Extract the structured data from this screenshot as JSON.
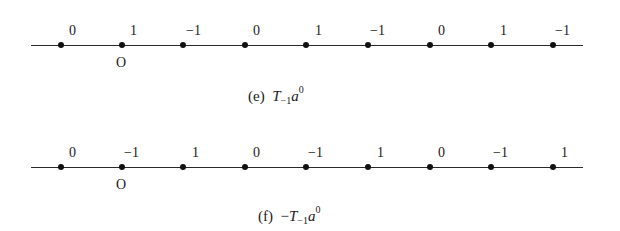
{
  "figures": [
    {
      "id": "e",
      "caption": {
        "label": "(e)",
        "prefix": "",
        "op": "T",
        "op_sub": "−1",
        "var": "a",
        "var_sup": "0"
      },
      "origin_label": "O",
      "origin_index": 1,
      "values": [
        "0",
        "1",
        "−1",
        "0",
        "1",
        "−1",
        "0",
        "1",
        "−1"
      ]
    },
    {
      "id": "f",
      "caption": {
        "label": "(f)",
        "prefix": "−",
        "op": "T",
        "op_sub": "−1",
        "var": "a",
        "var_sup": "0"
      },
      "origin_label": "O",
      "origin_index": 1,
      "values": [
        "0",
        "−1",
        "1",
        "0",
        "−1",
        "1",
        "0",
        "−1",
        "1"
      ]
    }
  ]
}
